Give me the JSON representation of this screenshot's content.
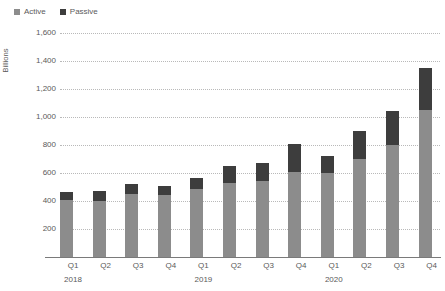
{
  "chart_data": {
    "type": "bar",
    "subtype": "stacked-column",
    "title": "",
    "xlabel": "",
    "ylabel": "Billions",
    "ylim": [
      0,
      1600
    ],
    "ytick_step": 200,
    "ytick_labels": [
      "1,600",
      "1,400",
      "1,200",
      "1,000",
      "800",
      "600",
      "400",
      "200",
      "–"
    ],
    "ytick_values": [
      1600,
      1400,
      1200,
      1000,
      800,
      600,
      400,
      200,
      0
    ],
    "grid": true,
    "grid_style": "dotted-horizontal",
    "legend": {
      "position": "top-left",
      "entries": [
        {
          "name": "Active",
          "color": "#8c8c8c"
        },
        {
          "name": "Passive",
          "color": "#3d3d3d"
        }
      ]
    },
    "categories": [
      "Q1",
      "Q2",
      "Q3",
      "Q4",
      "Q1",
      "Q2",
      "Q3",
      "Q4",
      "Q1",
      "Q2",
      "Q3",
      "Q4"
    ],
    "group_labels": [
      {
        "label": "2018",
        "at_index": 0
      },
      {
        "label": "2019",
        "at_index": 4
      },
      {
        "label": "2020",
        "at_index": 8
      }
    ],
    "series": [
      {
        "name": "Active",
        "color": "#8c8c8c",
        "values": [
          405,
          400,
          450,
          440,
          485,
          530,
          545,
          610,
          600,
          700,
          800,
          1050
        ]
      },
      {
        "name": "Passive",
        "color": "#3d3d3d",
        "values": [
          60,
          75,
          70,
          65,
          80,
          120,
          130,
          200,
          125,
          200,
          245,
          300
        ]
      }
    ],
    "totals": [
      465,
      475,
      520,
      505,
      565,
      650,
      675,
      810,
      725,
      900,
      1045,
      1350
    ],
    "axis_colors": {
      "gridline": "#b9b9b9",
      "baseline": "#7a7a7a",
      "text": "#5a5a5a"
    }
  }
}
